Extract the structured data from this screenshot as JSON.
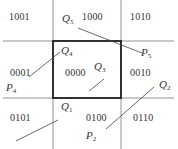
{
  "diagram": {
    "type": "Cohen-Sutherland clipping region codes",
    "window": {
      "x1": 53,
      "y1": 41,
      "x2": 121,
      "y2": 98
    },
    "region_codes": [
      {
        "id": "top-left",
        "code": "1001",
        "x": 9,
        "y": 12
      },
      {
        "id": "top",
        "code": "1000",
        "x": 82,
        "y": 12
      },
      {
        "id": "top-right",
        "code": "1010",
        "x": 130,
        "y": 12
      },
      {
        "id": "left",
        "code": "0001",
        "x": 10,
        "y": 68
      },
      {
        "id": "center",
        "code": "0000",
        "x": 65,
        "y": 68
      },
      {
        "id": "right",
        "code": "0010",
        "x": 130,
        "y": 68
      },
      {
        "id": "bottom-left",
        "code": "0101",
        "x": 10,
        "y": 113
      },
      {
        "id": "bottom",
        "code": "0100",
        "x": 86,
        "y": 113
      },
      {
        "id": "bottom-right",
        "code": "0110",
        "x": 133,
        "y": 113
      }
    ],
    "points": [
      {
        "id": "Q5",
        "name": "Q",
        "sub": "5",
        "x": 62,
        "y": 13
      },
      {
        "id": "P5",
        "name": "P",
        "sub": "5",
        "x": 141,
        "y": 47
      },
      {
        "id": "Q4",
        "name": "Q",
        "sub": "4",
        "x": 61,
        "y": 47
      },
      {
        "id": "P4",
        "name": "P",
        "sub": "4",
        "x": 6,
        "y": 84
      },
      {
        "id": "Q3",
        "name": "Q",
        "sub": "3",
        "x": 94,
        "y": 62
      },
      {
        "id": "Q1",
        "name": "Q",
        "sub": "1",
        "x": 61,
        "y": 102
      },
      {
        "id": "Q2",
        "name": "Q",
        "sub": "2",
        "x": 159,
        "y": 80
      },
      {
        "id": "P2",
        "name": "P",
        "sub": "2",
        "x": 86,
        "y": 131
      }
    ],
    "segments": [
      {
        "id": "P5-Q5",
        "x1": 78,
        "y1": 28,
        "x2": 142,
        "y2": 53
      },
      {
        "id": "P4-Q4",
        "x1": 29,
        "y1": 77,
        "x2": 60,
        "y2": 52
      },
      {
        "id": "Q3-seg",
        "x1": 89,
        "y1": 91,
        "x2": 104,
        "y2": 79
      },
      {
        "id": "Q1-seg",
        "x1": 16,
        "y1": 141,
        "x2": 58,
        "y2": 120
      },
      {
        "id": "P2-Q2",
        "x1": 106,
        "y1": 129,
        "x2": 154,
        "y2": 87
      }
    ]
  }
}
